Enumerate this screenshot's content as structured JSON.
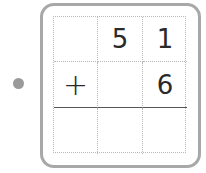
{
  "problem": {
    "rows": [
      [
        "",
        "5",
        "1"
      ],
      [
        "+",
        "",
        "6"
      ],
      [
        "",
        "",
        ""
      ]
    ]
  }
}
